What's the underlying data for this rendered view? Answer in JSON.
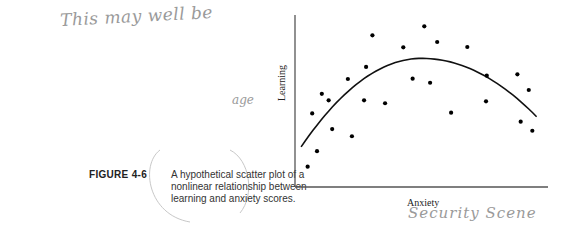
{
  "annotations": {
    "handwritten_top": "This may well be",
    "handwritten_mid": "age",
    "handwritten_bottom": "Security  Scene"
  },
  "caption": {
    "label": "FIGURE 4-6",
    "text": "A hypothetical scatter plot of a nonlinear relationship between learning and anxiety scores."
  },
  "chart_data": {
    "type": "scatter",
    "title": "",
    "xlabel": "Anxiety",
    "ylabel": "Learning",
    "xlim": [
      0,
      10
    ],
    "ylim": [
      0,
      10
    ],
    "grid": false,
    "ticks": false,
    "legend": null,
    "points": [
      {
        "x": 0.5,
        "y": 1.18
      },
      {
        "x": 0.68,
        "y": 4.28
      },
      {
        "x": 0.87,
        "y": 2.08
      },
      {
        "x": 1.06,
        "y": 5.42
      },
      {
        "x": 1.33,
        "y": 5.04
      },
      {
        "x": 1.47,
        "y": 3.37
      },
      {
        "x": 2.09,
        "y": 6.28
      },
      {
        "x": 2.25,
        "y": 2.95
      },
      {
        "x": 2.81,
        "y": 6.98
      },
      {
        "x": 3.06,
        "y": 8.82
      },
      {
        "x": 2.73,
        "y": 5.04
      },
      {
        "x": 3.56,
        "y": 4.87
      },
      {
        "x": 4.28,
        "y": 8.12
      },
      {
        "x": 5.11,
        "y": 9.34
      },
      {
        "x": 5.62,
        "y": 8.43
      },
      {
        "x": 6.81,
        "y": 8.14
      },
      {
        "x": 4.65,
        "y": 6.3
      },
      {
        "x": 5.34,
        "y": 6.06
      },
      {
        "x": 6.17,
        "y": 4.32
      },
      {
        "x": 7.58,
        "y": 6.47
      },
      {
        "x": 7.55,
        "y": 4.98
      },
      {
        "x": 8.79,
        "y": 6.55
      },
      {
        "x": 9.24,
        "y": 5.64
      },
      {
        "x": 8.92,
        "y": 3.8
      },
      {
        "x": 9.38,
        "y": 3.27
      }
    ],
    "fit_curve": {
      "type": "quadratic (inverted-U)",
      "start": {
        "x": 0.24,
        "y": 2.33
      },
      "peak": {
        "x": 5.01,
        "y": 7.48
      },
      "end": {
        "x": 9.55,
        "y": 4.09
      }
    }
  },
  "style": {
    "point_color": "#000000",
    "curve_color": "#111111",
    "axis_color": "#555555",
    "handwriting_color": "#9a9a9a"
  }
}
